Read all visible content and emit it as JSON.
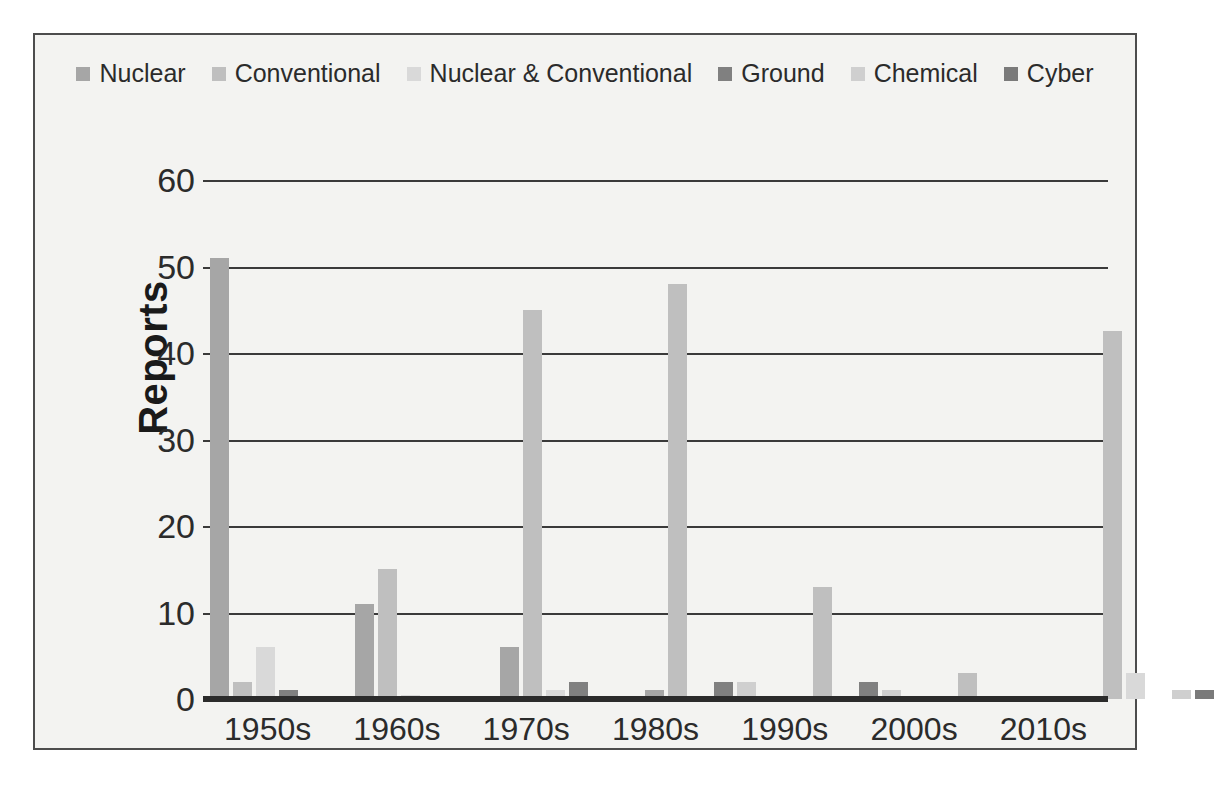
{
  "chart_data": {
    "type": "bar",
    "title": "",
    "subtitle": "",
    "xlabel": "",
    "ylabel": "Reports",
    "categories": [
      "1950s",
      "1960s",
      "1970s",
      "1980s",
      "1990s",
      "2000s",
      "2010s"
    ],
    "ylim": [
      0,
      60
    ],
    "yticks": [
      0,
      10,
      20,
      30,
      40,
      50,
      60
    ],
    "ytick_labels": [
      "0",
      "10",
      "20",
      "30",
      "40",
      "50",
      "60"
    ],
    "grid": "horizontal",
    "legend_position": "top",
    "series": [
      {
        "name": "Nuclear",
        "color": "#a6a6a6",
        "values": [
          51,
          11,
          6,
          1,
          0,
          0,
          0
        ]
      },
      {
        "name": "Conventional",
        "color": "#bfbfbf",
        "values": [
          2,
          15,
          45,
          48,
          13,
          3,
          42.5
        ]
      },
      {
        "name": "Nuclear & Conventional",
        "color": "#d9d9d9",
        "values": [
          6,
          0.5,
          1,
          0,
          0,
          0.3,
          3
        ]
      },
      {
        "name": "Ground",
        "color": "#808080",
        "values": [
          1,
          0,
          2,
          2,
          2,
          0,
          0
        ]
      },
      {
        "name": "Chemical",
        "color": "#cfcfcf",
        "values": [
          0,
          0,
          0,
          2,
          1,
          0,
          1
        ]
      },
      {
        "name": "Cyber",
        "color": "#7a7a7a",
        "values": [
          0,
          0,
          0,
          0,
          0,
          0,
          1
        ]
      }
    ]
  },
  "legend": {
    "items": [
      {
        "label": "Nuclear",
        "color": "#a6a6a6"
      },
      {
        "label": "Conventional",
        "color": "#bfbfbf"
      },
      {
        "label": "Nuclear & Conventional",
        "color": "#d9d9d9"
      },
      {
        "label": "Ground",
        "color": "#808080"
      },
      {
        "label": "Chemical",
        "color": "#cfcfcf"
      },
      {
        "label": "Cyber",
        "color": "#7a7a7a"
      }
    ]
  },
  "axis": {
    "y_title": "Reports"
  },
  "colors": {
    "background": "#f3f3f1",
    "border": "#4d4d4d",
    "gridline": "#3a3a3a",
    "text": "#2b2b2b"
  }
}
